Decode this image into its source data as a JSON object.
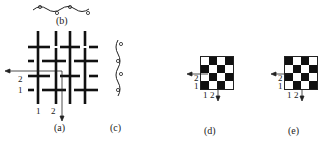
{
  "figure": {
    "panels": {
      "a": {
        "label": "(a)",
        "axis_labels_left": [
          "2",
          "1"
        ],
        "axis_labels_bottom": [
          "1",
          "2"
        ]
      },
      "b": {
        "label": "(b)"
      },
      "c": {
        "label": "(c)"
      },
      "d": {
        "label": "(d)",
        "row_labels": [
          "2",
          "1"
        ],
        "col_labels": [
          "1",
          "2"
        ],
        "grid": [
          [
            "w",
            "b",
            "w",
            "b"
          ],
          [
            "b",
            "w",
            "b",
            "w"
          ],
          [
            "w",
            "b",
            "w",
            "b"
          ],
          [
            "b",
            "w",
            "b",
            "w"
          ]
        ]
      },
      "e": {
        "label": "(e)",
        "row_labels": [
          "2",
          "1"
        ],
        "col_labels": [
          "1",
          "2"
        ],
        "grid": [
          [
            "b",
            "w",
            "b",
            "w"
          ],
          [
            "w",
            "b",
            "w",
            "b"
          ],
          [
            "b",
            "w",
            "b",
            "w"
          ],
          [
            "w",
            "b",
            "w",
            "b"
          ]
        ]
      }
    },
    "colors": {
      "ink": "#111111",
      "paper": "#ffffff"
    }
  }
}
